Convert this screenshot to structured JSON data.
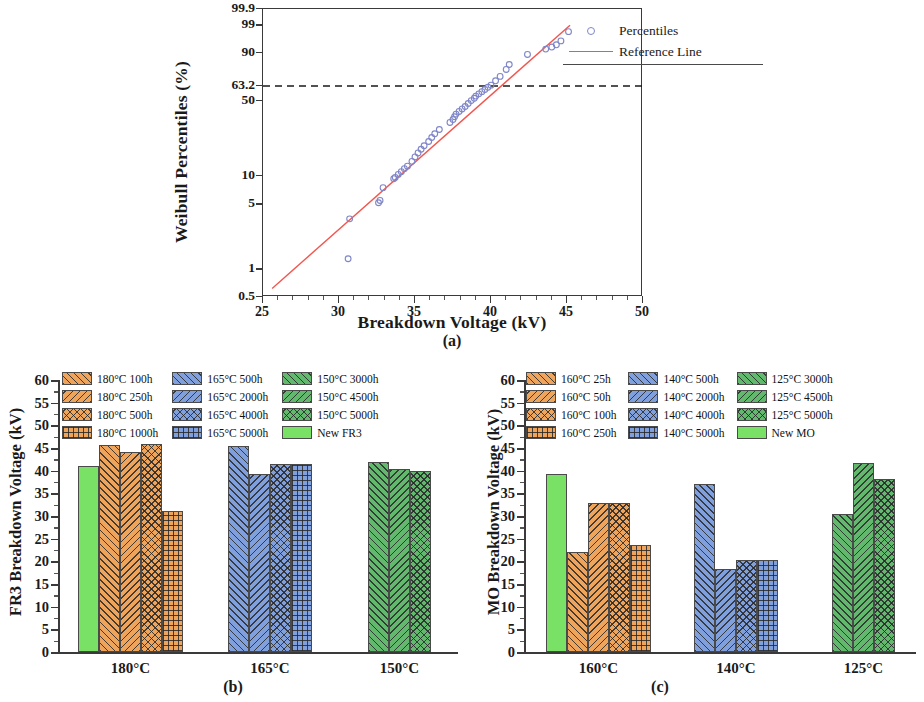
{
  "figure": {
    "captions": {
      "a": "(a)",
      "b": "(b)",
      "c": "(c)"
    }
  },
  "panel_a": {
    "caption": "(a)",
    "legend": [
      {
        "label": "Percentiles",
        "marker": "circle",
        "color": "#7f86c8"
      },
      {
        "label": "Reference Line",
        "marker": "line",
        "color": "#f2554e"
      }
    ]
  },
  "panel_b": {
    "caption": "(b)"
  },
  "panel_c": {
    "caption": "(c)"
  },
  "chart_data": [
    {
      "panel": "(a)",
      "type": "scatter",
      "title": "",
      "xlabel": "Breakdown Voltage (kV)",
      "ylabel": "Weibull Percentiles (%)",
      "xlim": [
        25,
        50
      ],
      "ylim": [
        0.5,
        99.9
      ],
      "yscale": "weibull-probability",
      "xticks": [
        25,
        30,
        35,
        40,
        45,
        50
      ],
      "yticks": [
        0.5,
        1,
        5,
        10,
        50,
        63.2,
        90,
        99,
        99.9
      ],
      "ytick_labels": [
        "0.5",
        "1",
        "5",
        "10",
        "50",
        "63.2",
        "90",
        "99",
        "99.9"
      ],
      "grid": false,
      "annotations": [
        {
          "type": "hline",
          "y": 63.2,
          "style": "dashed",
          "color": "#1a1a1a"
        }
      ],
      "legend": [
        "Percentiles",
        "Reference Line"
      ],
      "legend_position": "top-left-inside",
      "series": [
        {
          "name": "Percentiles",
          "marker": "open-circle",
          "color": "#7f86c8",
          "x": [
            30.6,
            30.7,
            32.6,
            32.7,
            32.9,
            33.6,
            33.7,
            33.9,
            34.1,
            34.3,
            34.5,
            34.8,
            35.0,
            35.2,
            35.4,
            35.6,
            35.9,
            36.1,
            36.3,
            36.6,
            37.3,
            37.5,
            37.6,
            37.7,
            37.9,
            38.1,
            38.3,
            38.5,
            38.7,
            38.9,
            39.0,
            39.2,
            39.4,
            39.6,
            39.8,
            40.0,
            40.3,
            40.6,
            41.0,
            41.2,
            42.4,
            43.6,
            44.0,
            44.3,
            44.6,
            45.1
          ],
          "y": [
            1.3,
            3.5,
            5.2,
            5.5,
            7.5,
            9.3,
            9.6,
            10.3,
            11.0,
            11.8,
            12.5,
            14.0,
            15.5,
            17.0,
            18.5,
            20.0,
            22.0,
            24.0,
            26.0,
            28.5,
            33.0,
            35.0,
            37.0,
            39.0,
            41.0,
            43.0,
            45.0,
            47.5,
            50.0,
            52.0,
            54.0,
            56.0,
            58.0,
            60.0,
            62.0,
            64.0,
            68.0,
            72.0,
            78.0,
            82.0,
            89.0,
            92.0,
            93.0,
            94.0,
            95.5,
            98.0
          ]
        },
        {
          "name": "Reference Line",
          "type": "line",
          "color": "#f2554e",
          "x": [
            25.6,
            45.2
          ],
          "y": [
            0.62,
            99.0
          ]
        }
      ]
    },
    {
      "panel": "(b)",
      "type": "bar",
      "title": "",
      "xlabel": "",
      "ylabel": "FR3 Breakdown Voltage (kV)",
      "ylim": [
        0,
        60
      ],
      "yticks": [
        0,
        5,
        10,
        15,
        20,
        25,
        30,
        35,
        40,
        45,
        50,
        55,
        60
      ],
      "grid": false,
      "legend_position": "top-inside",
      "categories": [
        "180°C",
        "165°C",
        "150°C"
      ],
      "legend": [
        {
          "label": "180°C 100h",
          "color": "#efa45c",
          "hatch": "diag-up",
          "column": 1
        },
        {
          "label": "180°C 250h",
          "color": "#efa45c",
          "hatch": "diag-down",
          "column": 1
        },
        {
          "label": "180°C 500h",
          "color": "#efa45c",
          "hatch": "cross-diag",
          "column": 1
        },
        {
          "label": "180°C 1000h",
          "color": "#efa45c",
          "hatch": "grid",
          "column": 1
        },
        {
          "label": "165°C 500h",
          "color": "#7f9fdd",
          "hatch": "diag-up",
          "column": 2
        },
        {
          "label": "165°C 2000h",
          "color": "#7f9fdd",
          "hatch": "diag-down",
          "column": 2
        },
        {
          "label": "165°C 4000h",
          "color": "#7f9fdd",
          "hatch": "cross-diag",
          "column": 2
        },
        {
          "label": "165°C 5000h",
          "color": "#7f9fdd",
          "hatch": "grid",
          "column": 2
        },
        {
          "label": "150°C 3000h",
          "color": "#62b96e",
          "hatch": "diag-up",
          "column": 3
        },
        {
          "label": "150°C 4500h",
          "color": "#62b96e",
          "hatch": "diag-down",
          "column": 3
        },
        {
          "label": "150°C 5000h",
          "color": "#62b96e",
          "hatch": "cross-diag",
          "column": 3
        },
        {
          "label": "New FR3",
          "color": "#79e266",
          "hatch": "none",
          "column": 3
        }
      ],
      "bars": [
        {
          "group": "180°C",
          "label": "New FR3",
          "value": 41.1,
          "color": "#79e266",
          "hatch": "none"
        },
        {
          "group": "180°C",
          "label": "180°C 100h",
          "value": 45.7,
          "color": "#efa45c",
          "hatch": "diag-up"
        },
        {
          "group": "180°C",
          "label": "180°C 250h",
          "value": 44.2,
          "color": "#efa45c",
          "hatch": "diag-down"
        },
        {
          "group": "180°C",
          "label": "180°C 500h",
          "value": 45.8,
          "color": "#efa45c",
          "hatch": "cross-diag"
        },
        {
          "group": "180°C",
          "label": "180°C 1000h",
          "value": 31.2,
          "color": "#efa45c",
          "hatch": "grid"
        },
        {
          "group": "165°C",
          "label": "165°C 500h",
          "value": 45.5,
          "color": "#7f9fdd",
          "hatch": "diag-up"
        },
        {
          "group": "165°C",
          "label": "165°C 2000h",
          "value": 39.2,
          "color": "#7f9fdd",
          "hatch": "diag-down"
        },
        {
          "group": "165°C",
          "label": "165°C 4000h",
          "value": 41.5,
          "color": "#7f9fdd",
          "hatch": "cross-diag"
        },
        {
          "group": "165°C",
          "label": "165°C 5000h",
          "value": 41.5,
          "color": "#7f9fdd",
          "hatch": "grid"
        },
        {
          "group": "150°C",
          "label": "150°C 3000h",
          "value": 41.9,
          "color": "#62b96e",
          "hatch": "diag-up"
        },
        {
          "group": "150°C",
          "label": "150°C 4500h",
          "value": 40.4,
          "color": "#62b96e",
          "hatch": "diag-down"
        },
        {
          "group": "150°C",
          "label": "150°C 5000h",
          "value": 39.9,
          "color": "#62b96e",
          "hatch": "cross-diag"
        }
      ]
    },
    {
      "panel": "(c)",
      "type": "bar",
      "title": "",
      "xlabel": "",
      "ylabel": "MO Breakdown Voltage (kV)",
      "ylim": [
        0,
        60
      ],
      "yticks": [
        0,
        5,
        10,
        15,
        20,
        25,
        30,
        35,
        40,
        45,
        50,
        55,
        60
      ],
      "grid": false,
      "legend_position": "top-inside",
      "categories": [
        "160°C",
        "140°C",
        "125°C"
      ],
      "legend": [
        {
          "label": "160°C 25h",
          "color": "#efa45c",
          "hatch": "diag-up",
          "column": 1
        },
        {
          "label": "160°C 50h",
          "color": "#efa45c",
          "hatch": "diag-down",
          "column": 1
        },
        {
          "label": "160°C 100h",
          "color": "#efa45c",
          "hatch": "cross-diag",
          "column": 1
        },
        {
          "label": "160°C 250h",
          "color": "#efa45c",
          "hatch": "grid",
          "column": 1
        },
        {
          "label": "140°C 500h",
          "color": "#7f9fdd",
          "hatch": "diag-up",
          "column": 2
        },
        {
          "label": "140°C 2000h",
          "color": "#7f9fdd",
          "hatch": "diag-down",
          "column": 2
        },
        {
          "label": "140°C 4000h",
          "color": "#7f9fdd",
          "hatch": "cross-diag",
          "column": 2
        },
        {
          "label": "140°C 5000h",
          "color": "#7f9fdd",
          "hatch": "grid",
          "column": 2
        },
        {
          "label": "125°C 3000h",
          "color": "#62b96e",
          "hatch": "diag-up",
          "column": 3
        },
        {
          "label": "125°C 4500h",
          "color": "#62b96e",
          "hatch": "diag-down",
          "column": 3
        },
        {
          "label": "125°C 5000h",
          "color": "#62b96e",
          "hatch": "cross-diag",
          "column": 3
        },
        {
          "label": "New MO",
          "color": "#79e266",
          "hatch": "none",
          "column": 3
        }
      ],
      "bars": [
        {
          "group": "160°C",
          "label": "New MO",
          "value": 39.2,
          "color": "#79e266",
          "hatch": "none"
        },
        {
          "group": "160°C",
          "label": "160°C 25h",
          "value": 22.1,
          "color": "#efa45c",
          "hatch": "diag-up"
        },
        {
          "group": "160°C",
          "label": "160°C 50h",
          "value": 32.9,
          "color": "#efa45c",
          "hatch": "diag-down"
        },
        {
          "group": "160°C",
          "label": "160°C 100h",
          "value": 32.9,
          "color": "#efa45c",
          "hatch": "cross-diag"
        },
        {
          "group": "160°C",
          "label": "160°C 250h",
          "value": 23.7,
          "color": "#efa45c",
          "hatch": "grid"
        },
        {
          "group": "140°C",
          "label": "140°C 500h",
          "value": 37.0,
          "color": "#7f9fdd",
          "hatch": "diag-up"
        },
        {
          "group": "140°C",
          "label": "140°C 2000h",
          "value": 18.4,
          "color": "#7f9fdd",
          "hatch": "diag-down"
        },
        {
          "group": "140°C",
          "label": "140°C 4000h",
          "value": 20.3,
          "color": "#7f9fdd",
          "hatch": "cross-diag"
        },
        {
          "group": "140°C",
          "label": "140°C 5000h",
          "value": 20.4,
          "color": "#7f9fdd",
          "hatch": "grid"
        },
        {
          "group": "125°C",
          "label": "125°C 3000h",
          "value": 30.4,
          "color": "#62b96e",
          "hatch": "diag-up"
        },
        {
          "group": "125°C",
          "label": "125°C 4500h",
          "value": 41.8,
          "color": "#62b96e",
          "hatch": "diag-down"
        },
        {
          "group": "125°C",
          "label": "125°C 5000h",
          "value": 38.1,
          "color": "#62b96e",
          "hatch": "cross-diag"
        }
      ]
    }
  ]
}
